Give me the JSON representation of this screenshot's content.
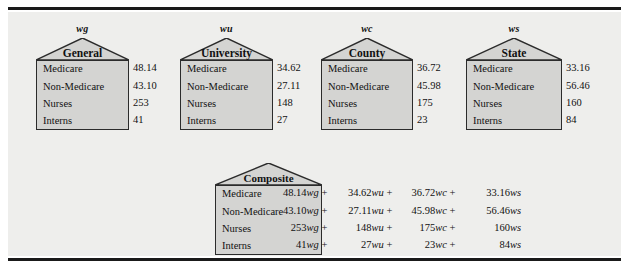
{
  "figure": {
    "background": "#eeeeec",
    "house_fill": "#d4d4d2",
    "line_color": "#2b2b2b",
    "row_labels": [
      "Medicare",
      "Non-Medicare",
      "Nurses",
      "Interns"
    ]
  },
  "houses": [
    {
      "weight": "wg",
      "title": "General",
      "values": [
        "48.14",
        "43.10",
        "253",
        "41"
      ]
    },
    {
      "weight": "wu",
      "title": "University",
      "values": [
        "34.62",
        "27.11",
        "148",
        "27"
      ]
    },
    {
      "weight": "wc",
      "title": "County",
      "values": [
        "36.72",
        "45.98",
        "175",
        "23"
      ]
    },
    {
      "weight": "ws",
      "title": "State",
      "values": [
        "33.16",
        "56.46",
        "160",
        "84"
      ]
    }
  ],
  "composite": {
    "title": "Composite",
    "rows": [
      {
        "label": "Medicare",
        "terms": [
          {
            "coef": "48.14",
            "w": "wg",
            "op": " + "
          },
          {
            "coef": "34.62",
            "w": "wu",
            "op": " + "
          },
          {
            "coef": "36.72",
            "w": "wc",
            "op": " + "
          },
          {
            "coef": "33.16",
            "w": "ws",
            "op": ""
          }
        ]
      },
      {
        "label": "Non-Medicare",
        "terms": [
          {
            "coef": "43.10",
            "w": "wg",
            "op": " + "
          },
          {
            "coef": "27.11",
            "w": "wu",
            "op": " + "
          },
          {
            "coef": "45.98",
            "w": "wc",
            "op": " + "
          },
          {
            "coef": "56.46",
            "w": "ws",
            "op": ""
          }
        ]
      },
      {
        "label": "Nurses",
        "terms": [
          {
            "coef": "253",
            "w": "wg",
            "op": " + "
          },
          {
            "coef": "148",
            "w": "wu",
            "op": " + "
          },
          {
            "coef": "175",
            "w": "wc",
            "op": " + "
          },
          {
            "coef": "160",
            "w": "ws",
            "op": ""
          }
        ]
      },
      {
        "label": "Interns",
        "terms": [
          {
            "coef": "41",
            "w": "wg",
            "op": " + "
          },
          {
            "coef": "27",
            "w": "wu",
            "op": " + "
          },
          {
            "coef": "23",
            "w": "wc",
            "op": " + "
          },
          {
            "coef": "84",
            "w": "ws",
            "op": ""
          }
        ]
      }
    ]
  }
}
